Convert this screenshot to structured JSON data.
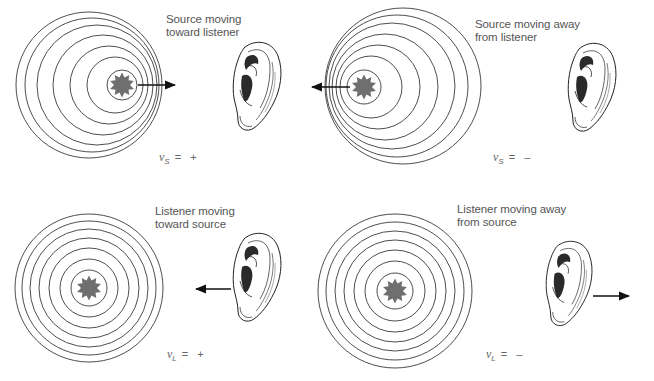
{
  "figure": {
    "panels": [
      {
        "id": "source-toward",
        "caption": [
          "Source moving",
          "toward listener"
        ],
        "equation": {
          "variable": "v",
          "subscript": "S",
          "rest": "= +"
        },
        "source": {
          "cx": 122,
          "cy": 85
        },
        "circles": [
          {
            "cx": 122,
            "cy": 85,
            "r": 15
          },
          {
            "cx": 115,
            "cy": 85,
            "r": 28
          },
          {
            "cx": 109,
            "cy": 85,
            "r": 39
          },
          {
            "cx": 103,
            "cy": 85,
            "r": 50
          },
          {
            "cx": 97,
            "cy": 85,
            "r": 60
          },
          {
            "cx": 92,
            "cy": 85,
            "r": 67
          },
          {
            "cx": 89,
            "cy": 85,
            "r": 73
          }
        ],
        "arrow": {
          "x1": 138,
          "y1": 85,
          "x2": 175,
          "y2": 85
        },
        "ear": {
          "x": 232,
          "y": 42,
          "scale": 1.0
        }
      },
      {
        "id": "source-away",
        "caption": [
          "Source moving away",
          "from listener"
        ],
        "equation": {
          "variable": "v",
          "subscript": "S",
          "rest": "= –"
        },
        "source": {
          "cx": 364,
          "cy": 87
        },
        "circles": [
          {
            "cx": 364,
            "cy": 87,
            "r": 17
          },
          {
            "cx": 371,
            "cy": 87,
            "r": 31
          },
          {
            "cx": 378,
            "cy": 87,
            "r": 42
          },
          {
            "cx": 385,
            "cy": 87,
            "r": 53
          },
          {
            "cx": 392,
            "cy": 86,
            "r": 63
          },
          {
            "cx": 397,
            "cy": 86,
            "r": 71
          },
          {
            "cx": 403,
            "cy": 86,
            "r": 78
          }
        ],
        "arrow": {
          "x1": 350,
          "y1": 87,
          "x2": 312,
          "y2": 87
        },
        "ear": {
          "x": 567,
          "y": 43,
          "scale": 1.0
        }
      },
      {
        "id": "listener-toward",
        "caption": [
          "Listener moving",
          "toward source"
        ],
        "equation": {
          "variable": "v",
          "subscript": "L",
          "rest": "= +"
        },
        "source": {
          "cx": 89,
          "cy": 288
        },
        "circles": [
          {
            "cx": 89,
            "cy": 288,
            "r": 18
          },
          {
            "cx": 89,
            "cy": 288,
            "r": 29
          },
          {
            "cx": 89,
            "cy": 288,
            "r": 40
          },
          {
            "cx": 89,
            "cy": 288,
            "r": 50
          },
          {
            "cx": 89,
            "cy": 288,
            "r": 59
          },
          {
            "cx": 89,
            "cy": 288,
            "r": 67
          },
          {
            "cx": 89,
            "cy": 288,
            "r": 74
          }
        ],
        "arrow": {
          "x1": 231,
          "y1": 289,
          "x2": 196,
          "y2": 289
        },
        "ear": {
          "x": 232,
          "y": 233,
          "scale": 1.0
        }
      },
      {
        "id": "listener-away",
        "caption": [
          "Listener moving away",
          "from source"
        ],
        "equation": {
          "variable": "v",
          "subscript": "L",
          "rest": "= –"
        },
        "source": {
          "cx": 395,
          "cy": 291
        },
        "circles": [
          {
            "cx": 395,
            "cy": 291,
            "r": 18
          },
          {
            "cx": 395,
            "cy": 291,
            "r": 30
          },
          {
            "cx": 395,
            "cy": 291,
            "r": 41
          },
          {
            "cx": 395,
            "cy": 291,
            "r": 51
          },
          {
            "cx": 395,
            "cy": 291,
            "r": 60
          },
          {
            "cx": 395,
            "cy": 291,
            "r": 69
          },
          {
            "cx": 395,
            "cy": 291,
            "r": 77
          }
        ],
        "arrow": {
          "x1": 593,
          "y1": 296,
          "x2": 629,
          "y2": 296
        },
        "ear": {
          "x": 545,
          "y": 241,
          "scale": 0.96
        }
      }
    ],
    "colors": {
      "circle_stroke": "#3a3a3a",
      "source_fill": "#6f6f6f",
      "arrow": "#111111",
      "text": "#555555"
    }
  }
}
